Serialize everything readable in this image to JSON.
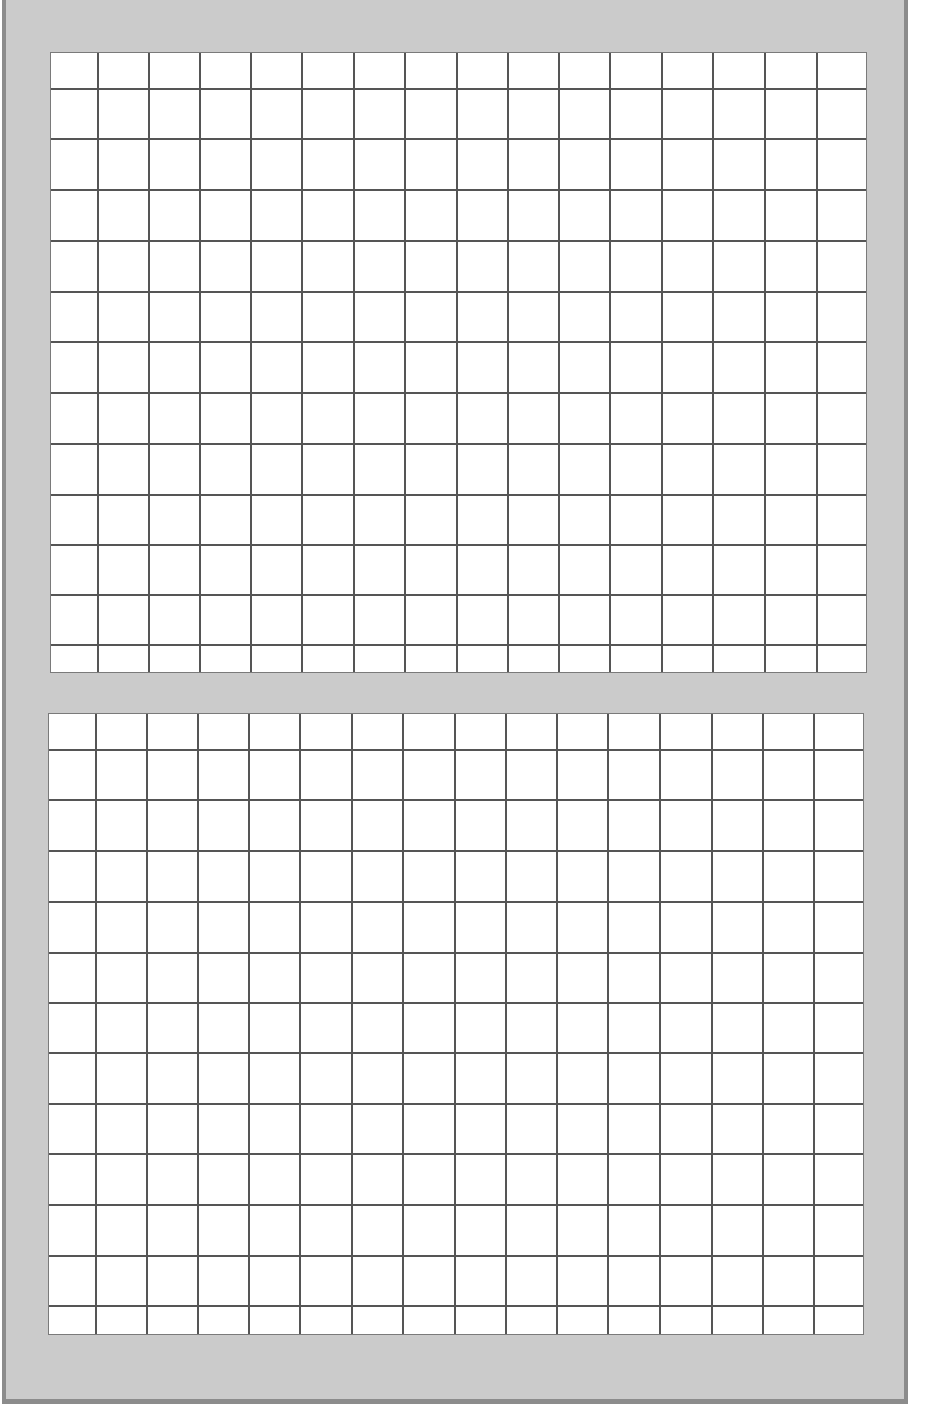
{
  "colors": {
    "frame_fill": "#cbcbcb",
    "frame_border": "#8c8c8c",
    "grid_paper": "#ffffff",
    "grid_line": "#555555"
  },
  "grids": [
    {
      "name": "top-grid",
      "left": 50,
      "top": 52,
      "right": 867,
      "bottom": 673,
      "columns": 16,
      "rows": 13,
      "vlines": [
        97,
        148,
        199,
        250,
        301,
        353,
        404,
        456,
        507,
        558,
        609,
        661,
        712,
        764,
        816
      ],
      "hlines": [
        88,
        138,
        189,
        240,
        291,
        341,
        392,
        443,
        494,
        544,
        594,
        644
      ]
    },
    {
      "name": "bottom-grid",
      "left": 48,
      "top": 713,
      "right": 864,
      "bottom": 1335,
      "columns": 16,
      "rows": 13,
      "vlines": [
        95,
        146,
        197,
        248,
        299,
        351,
        402,
        454,
        505,
        556,
        607,
        659,
        711,
        762,
        813
      ],
      "hlines": [
        749,
        799,
        850,
        901,
        952,
        1002,
        1052,
        1103,
        1153,
        1204,
        1255,
        1305
      ]
    }
  ]
}
